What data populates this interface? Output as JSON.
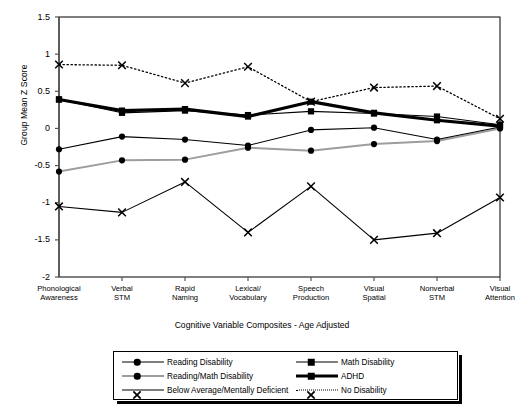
{
  "chart_data": {
    "type": "line",
    "title": "",
    "xlabel": "Cognitive Variable Composites - Age Adjusted",
    "ylabel": "Group Mean Z Score",
    "categories": [
      "Phonological Awareness",
      "Verbal STM",
      "Rapid Naming",
      "Lexical/ Vocabulary",
      "Speech Production",
      "Visual Spatial",
      "Nonverbal STM",
      "Visual Attention"
    ],
    "ylim": [
      -2,
      1.5
    ],
    "yticks": [
      1.5,
      1,
      0.5,
      0,
      -0.5,
      -1,
      -1.5,
      -2
    ],
    "ytick_labels": [
      "1.5",
      "1",
      "0.5",
      "0",
      "-0.5",
      "-1",
      "-1.5",
      "-2"
    ],
    "grid": false,
    "legend_position": "bottom",
    "series": [
      {
        "name": "Reading Disability",
        "marker": "circle",
        "line": "solid-thin",
        "color": "#000000",
        "values": [
          -0.28,
          -0.11,
          -0.15,
          -0.23,
          -0.02,
          0.01,
          -0.15,
          0.02
        ]
      },
      {
        "name": "Math Disability",
        "marker": "square",
        "line": "solid-thin",
        "color": "#000000",
        "values": [
          0.39,
          0.21,
          0.24,
          0.18,
          0.23,
          0.2,
          0.16,
          0.05
        ]
      },
      {
        "name": "Reading/Math Disability",
        "marker": "circle",
        "line": "gray",
        "color": "#9d9d9d",
        "values": [
          -0.58,
          -0.43,
          -0.42,
          -0.26,
          -0.3,
          -0.21,
          -0.17,
          0.0
        ]
      },
      {
        "name": "ADHD",
        "marker": "square",
        "line": "solid-thick",
        "color": "#000000",
        "values": [
          0.39,
          0.24,
          0.26,
          0.16,
          0.36,
          0.21,
          0.11,
          0.03
        ]
      },
      {
        "name": "Below Average/Mentally Deficient",
        "marker": "x",
        "line": "solid-thin",
        "color": "#000000",
        "values": [
          -1.05,
          -1.13,
          -0.72,
          -1.4,
          -0.78,
          -1.5,
          -1.41,
          -0.93
        ]
      },
      {
        "name": "No Disability",
        "marker": "x",
        "line": "dotted",
        "color": "#000000",
        "values": [
          0.86,
          0.85,
          0.61,
          0.83,
          0.36,
          0.55,
          0.57,
          0.13
        ]
      }
    ]
  },
  "axis": {
    "ylabel": "Group Mean Z Score",
    "xlabel": "Cognitive Variable Composites - Age Adjusted"
  },
  "xtick_lines": [
    [
      "Phonological",
      "Awareness"
    ],
    [
      "Verbal",
      "STM"
    ],
    [
      "Rapid",
      "Naming"
    ],
    [
      "Lexical/",
      "Vocabulary"
    ],
    [
      "Speech",
      "Production"
    ],
    [
      "Visual",
      "Spatial"
    ],
    [
      "Nonverbal",
      "STM"
    ],
    [
      "Visual",
      "Attention"
    ]
  ],
  "legend": {
    "entries": [
      {
        "label": "Reading Disability",
        "marker": "circle",
        "line": "solid-thin",
        "col": 0,
        "row": 0
      },
      {
        "label": "Math Disability",
        "marker": "square",
        "line": "solid-thin",
        "col": 1,
        "row": 0
      },
      {
        "label": "Reading/Math Disability",
        "marker": "circle",
        "line": "gray",
        "col": 0,
        "row": 1
      },
      {
        "label": "ADHD",
        "marker": "square",
        "line": "solid-thick",
        "col": 1,
        "row": 1
      },
      {
        "label": "Below Average/Mentally Deficient",
        "marker": "x",
        "line": "solid-thin",
        "col": 0,
        "row": 2
      },
      {
        "label": "No Disability",
        "marker": "x",
        "line": "dotted",
        "col": 1,
        "row": 2
      }
    ]
  }
}
